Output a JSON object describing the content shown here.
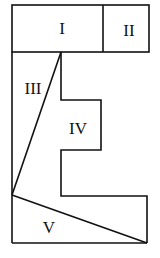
{
  "diagram": {
    "type": "tangram-like dissection figure",
    "pieces": [
      {
        "id": "I",
        "label": "I",
        "x": 62,
        "y": 28
      },
      {
        "id": "II",
        "label": "II",
        "x": 129,
        "y": 30
      },
      {
        "id": "III",
        "label": "III",
        "x": 33,
        "y": 88
      },
      {
        "id": "IV",
        "label": "IV",
        "x": 78,
        "y": 128
      },
      {
        "id": "V",
        "label": "V",
        "x": 49,
        "y": 227
      }
    ],
    "colors": {
      "stroke": "#111111",
      "background": "#ffffff"
    }
  }
}
